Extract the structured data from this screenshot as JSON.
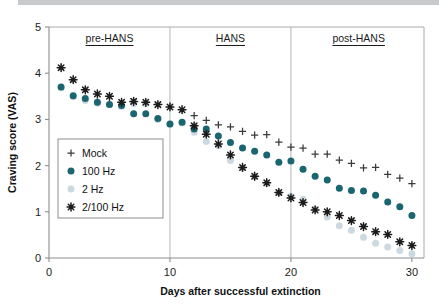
{
  "chart_data": {
    "type": "scatter",
    "title": "",
    "xlabel": "Days after successful extinction",
    "ylabel": "Craving score (VAS)",
    "xlim": [
      0,
      31
    ],
    "ylim": [
      0,
      5
    ],
    "xticks": [
      0,
      10,
      20,
      30
    ],
    "yticks": [
      0,
      1,
      2,
      3,
      4,
      5
    ],
    "grid": false,
    "legend_position": "inside-left",
    "x": [
      1,
      2,
      3,
      4,
      5,
      6,
      7,
      8,
      9,
      10,
      11,
      12,
      13,
      14,
      15,
      16,
      17,
      18,
      19,
      20,
      21,
      22,
      23,
      24,
      25,
      26,
      27,
      28,
      29,
      30
    ],
    "series": [
      {
        "name": "Mock",
        "marker": "plus",
        "color": "#3a3a3a",
        "values": [
          null,
          null,
          null,
          null,
          null,
          null,
          null,
          null,
          null,
          null,
          null,
          3.08,
          2.98,
          2.88,
          2.84,
          2.74,
          2.66,
          2.67,
          2.51,
          2.4,
          2.38,
          2.25,
          2.25,
          2.12,
          2.05,
          1.95,
          1.96,
          1.81,
          1.73,
          1.61
        ]
      },
      {
        "name": "100 Hz",
        "marker": "circle",
        "color": "#1a6670",
        "values": [
          3.7,
          3.51,
          3.45,
          3.37,
          3.32,
          3.3,
          3.12,
          3.12,
          3.02,
          2.9,
          2.94,
          2.79,
          2.79,
          2.64,
          2.5,
          2.38,
          2.31,
          2.23,
          2.07,
          2.1,
          1.92,
          1.77,
          1.69,
          1.51,
          1.46,
          1.45,
          1.36,
          1.21,
          1.11,
          0.92
        ]
      },
      {
        "name": "2 Hz",
        "marker": "circle",
        "color": "#cdd9e0",
        "values": [
          3.68,
          3.49,
          3.41,
          3.35,
          3.32,
          3.28,
          3.34,
          3.34,
          3.0,
          2.89,
          2.92,
          2.72,
          2.52,
          2.43,
          2.11,
          1.95,
          1.76,
          1.61,
          1.41,
          1.34,
          1.27,
          1.06,
          0.89,
          0.7,
          0.6,
          0.45,
          0.32,
          0.24,
          0.16,
          0.09
        ]
      },
      {
        "name": "2/100 Hz",
        "marker": "asterisk",
        "color": "#1b1b1b",
        "values": [
          4.12,
          3.86,
          3.64,
          3.55,
          3.5,
          3.37,
          3.39,
          3.37,
          3.32,
          3.27,
          3.21,
          2.86,
          2.68,
          2.47,
          2.23,
          1.96,
          1.77,
          1.63,
          1.42,
          1.3,
          1.2,
          1.04,
          1.0,
          0.92,
          0.81,
          0.68,
          0.57,
          0.51,
          0.35,
          0.27
        ]
      }
    ],
    "phase_annotations": [
      {
        "label": "pre-HANS",
        "x_start": 0,
        "x_end": 10,
        "x_center": 5.0
      },
      {
        "label": "HANS",
        "x_start": 10,
        "x_end": 20,
        "x_center": 15.0
      },
      {
        "label": "post-HANS",
        "x_start": 20,
        "x_end": 31,
        "x_center": 25.6
      }
    ],
    "phase_dividers": [
      10,
      20
    ],
    "legend": [
      {
        "label": "Mock",
        "marker": "plus",
        "color": "#3a3a3a"
      },
      {
        "label": "100 Hz",
        "marker": "circle",
        "color": "#1a6670"
      },
      {
        "label": "2 Hz",
        "marker": "circle",
        "color": "#cdd9e0"
      },
      {
        "label": "2/100 Hz",
        "marker": "asterisk",
        "color": "#1b1b1b"
      }
    ]
  }
}
